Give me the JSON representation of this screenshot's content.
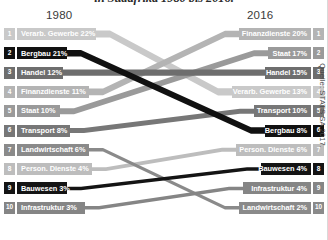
{
  "title": "in Südafrika 1980 bis 2016.",
  "header": {
    "year_left": "1980",
    "year_right": "2016"
  },
  "source": "Quelle: STATS SA 2017.",
  "left": {
    "year": "1980",
    "rows": [
      {
        "rank": "1",
        "label": "Verarb. Gewerbe 22%",
        "sector": "verarb-gewerbe",
        "value": 22,
        "color": "#c9c9c9"
      },
      {
        "rank": "2",
        "label": "Bergbau 21%",
        "sector": "bergbau",
        "value": 21,
        "color": "#111111"
      },
      {
        "rank": "3",
        "label": "Handel 12%",
        "sector": "handel",
        "value": 12,
        "color": "#6e6e6e"
      },
      {
        "rank": "4",
        "label": "Finanzdienste 11%",
        "sector": "finanzdienste",
        "value": 11,
        "color": "#b4b4b4"
      },
      {
        "rank": "5",
        "label": "Staat 10%",
        "sector": "staat",
        "value": 10,
        "color": "#9a9a9a"
      },
      {
        "rank": "6",
        "label": "Transport 8%",
        "sector": "transport",
        "value": 8,
        "color": "#777777"
      },
      {
        "rank": "7",
        "label": "Landwirtschaft 6%",
        "sector": "landwirtschaft",
        "value": 6,
        "color": "#8a8a8a"
      },
      {
        "rank": "8",
        "label": "Person. Dienste 4%",
        "sector": "person-dienste",
        "value": 4,
        "color": "#bdbdbd"
      },
      {
        "rank": "9",
        "label": "Bauwesen 3%",
        "sector": "bauwesen",
        "value": 3,
        "color": "#141414"
      },
      {
        "rank": "10",
        "label": "Infrastruktur 3%",
        "sector": "infrastruktur",
        "value": 3,
        "color": "#858585"
      }
    ]
  },
  "right": {
    "year": "2016",
    "rows": [
      {
        "rank": "1",
        "label": "Finanzdienste 20%",
        "sector": "finanzdienste",
        "value": 20,
        "color": "#b4b4b4"
      },
      {
        "rank": "2",
        "label": "Staat 17%",
        "sector": "staat",
        "value": 17,
        "color": "#9a9a9a"
      },
      {
        "rank": "3",
        "label": "Handel 15%",
        "sector": "handel",
        "value": 15,
        "color": "#6e6e6e"
      },
      {
        "rank": "4",
        "label": "Verarb. Gewerbe 13%",
        "sector": "verarb-gewerbe",
        "value": 13,
        "color": "#c9c9c9"
      },
      {
        "rank": "5",
        "label": "Transport 10%",
        "sector": "transport",
        "value": 10,
        "color": "#777777"
      },
      {
        "rank": "6",
        "label": "Bergbau 8%",
        "sector": "bergbau",
        "value": 8,
        "color": "#111111"
      },
      {
        "rank": "7",
        "label": "Person. Dienste 6%",
        "sector": "person-dienste",
        "value": 6,
        "color": "#bdbdbd"
      },
      {
        "rank": "8",
        "label": "Bauwesen 4%",
        "sector": "bauwesen",
        "value": 4,
        "color": "#141414"
      },
      {
        "rank": "9",
        "label": "Infrastruktur 4%",
        "sector": "infrastruktur",
        "value": 4,
        "color": "#858585"
      },
      {
        "rank": "10",
        "label": "Landwirtschaft 2%",
        "sector": "landwirtschaft",
        "value": 2,
        "color": "#8a8a8a"
      }
    ]
  },
  "chart_data": {
    "type": "bar",
    "subtype": "slope-ranking-bump",
    "title": "in Südafrika 1980 bis 2016.",
    "xlabel": "",
    "ylabel": "Rang",
    "categories": [
      "1980",
      "2016"
    ],
    "unit": "%",
    "note": "Anteile der Wirtschaftssektoren, sortiert nach Rang; Bänder verbinden denselben Sektor in beiden Jahren.",
    "series": [
      {
        "name": "Verarb. Gewerbe",
        "values": [
          22,
          13
        ],
        "ranks": [
          1,
          4
        ],
        "color": "#c9c9c9"
      },
      {
        "name": "Bergbau",
        "values": [
          21,
          8
        ],
        "ranks": [
          2,
          6
        ],
        "color": "#111111"
      },
      {
        "name": "Handel",
        "values": [
          12,
          15
        ],
        "ranks": [
          3,
          3
        ],
        "color": "#6e6e6e"
      },
      {
        "name": "Finanzdienste",
        "values": [
          11,
          20
        ],
        "ranks": [
          4,
          1
        ],
        "color": "#b4b4b4"
      },
      {
        "name": "Staat",
        "values": [
          10,
          17
        ],
        "ranks": [
          5,
          2
        ],
        "color": "#9a9a9a"
      },
      {
        "name": "Transport",
        "values": [
          8,
          10
        ],
        "ranks": [
          6,
          5
        ],
        "color": "#777777"
      },
      {
        "name": "Landwirtschaft",
        "values": [
          6,
          2
        ],
        "ranks": [
          7,
          10
        ],
        "color": "#8a8a8a"
      },
      {
        "name": "Person. Dienste",
        "values": [
          4,
          6
        ],
        "ranks": [
          8,
          7
        ],
        "color": "#bdbdbd"
      },
      {
        "name": "Bauwesen",
        "values": [
          3,
          4
        ],
        "ranks": [
          9,
          8
        ],
        "color": "#141414"
      },
      {
        "name": "Infrastruktur",
        "values": [
          3,
          4
        ],
        "ranks": [
          10,
          9
        ],
        "color": "#858585"
      }
    ],
    "ylim": [
      1,
      10
    ],
    "grid": false,
    "legend": "none",
    "source": "Quelle: STATS SA 2017."
  }
}
